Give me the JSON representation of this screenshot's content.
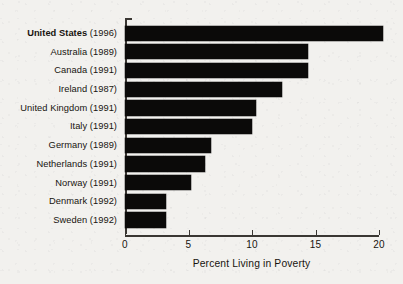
{
  "chart_data": {
    "type": "bar",
    "orientation": "horizontal",
    "title": "",
    "xlabel": "Percent Living in Poverty",
    "ylabel": "",
    "xlim": [
      0,
      20
    ],
    "xticks": [
      0,
      5,
      10,
      15,
      20
    ],
    "xtick_labels": [
      "0",
      "5",
      "10",
      "15",
      "20"
    ],
    "grid": false,
    "legend": null,
    "bar_color": "#0b0a09",
    "background_color": "#f2f1ee",
    "axis_color": "#3a3733",
    "categories": [
      "United States (1996)",
      "Australia (1989)",
      "Canada (1991)",
      "Ireland (1987)",
      "United Kingdom (1991)",
      "Italy (1991)",
      "Germany (1989)",
      "Netherlands (1991)",
      "Norway (1991)",
      "Denmark (1992)",
      "Sweden (1992)"
    ],
    "values": [
      20.3,
      14.4,
      14.4,
      12.4,
      10.3,
      10.0,
      6.8,
      6.3,
      5.2,
      3.2,
      3.2
    ],
    "items": [
      {
        "country": "United States",
        "year": "(1996)",
        "value": 20.3,
        "highlight": true
      },
      {
        "country": "Australia",
        "year": "(1989)",
        "value": 14.4,
        "highlight": false
      },
      {
        "country": "Canada",
        "year": "(1991)",
        "value": 14.4,
        "highlight": false
      },
      {
        "country": "Ireland",
        "year": "(1987)",
        "value": 12.4,
        "highlight": false
      },
      {
        "country": "United Kingdom",
        "year": "(1991)",
        "value": 10.3,
        "highlight": false
      },
      {
        "country": "Italy",
        "year": "(1991)",
        "value": 10.0,
        "highlight": false
      },
      {
        "country": "Germany",
        "year": "(1989)",
        "value": 6.8,
        "highlight": false
      },
      {
        "country": "Netherlands",
        "year": "(1991)",
        "value": 6.3,
        "highlight": false
      },
      {
        "country": "Norway",
        "year": "(1991)",
        "value": 5.2,
        "highlight": false
      },
      {
        "country": "Denmark",
        "year": "(1992)",
        "value": 3.2,
        "highlight": false
      },
      {
        "country": "Sweden",
        "year": "(1992)",
        "value": 3.2,
        "highlight": false
      }
    ]
  }
}
